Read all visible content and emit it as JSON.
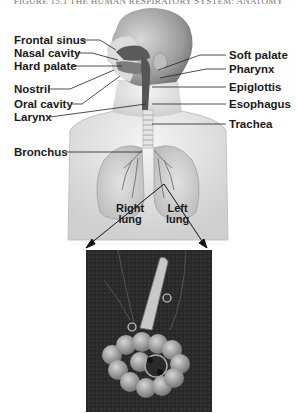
{
  "header": {
    "text": "FIGURE 15.1 THE HUMAN RESPIRATORY SYSTEM: ANATOMY"
  },
  "figure": {
    "title": "Human respiratory system",
    "left_labels": [
      {
        "id": "frontal-sinus",
        "text": "Frontal sinus"
      },
      {
        "id": "nasal-cavity",
        "text": "Nasal cavity"
      },
      {
        "id": "hard-palate",
        "text": "Hard palate"
      },
      {
        "id": "nostril",
        "text": "Nostril"
      },
      {
        "id": "oral-cavity",
        "text": "Oral cavity"
      },
      {
        "id": "larynx",
        "text": "Larynx"
      },
      {
        "id": "bronchus",
        "text": "Bronchus"
      }
    ],
    "right_labels": [
      {
        "id": "soft-palate",
        "text": "Soft palate"
      },
      {
        "id": "pharynx",
        "text": "Pharynx"
      },
      {
        "id": "epiglottis",
        "text": "Epiglottis"
      },
      {
        "id": "esophagus",
        "text": "Esophagus"
      },
      {
        "id": "trachea",
        "text": "Trachea"
      }
    ],
    "lung_labels": {
      "right": {
        "line1": "Right",
        "line2": "lung"
      },
      "left": {
        "line1": "Left",
        "line2": "lung"
      }
    },
    "inset": {
      "subject": "alveoli"
    }
  }
}
